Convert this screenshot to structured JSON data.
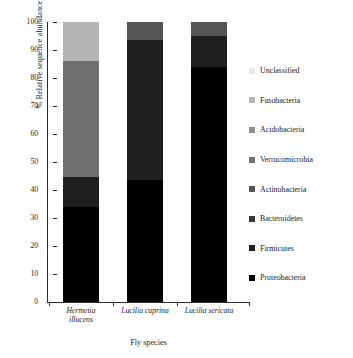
{
  "chart_data": {
    "type": "bar",
    "stacked": true,
    "title": "",
    "xlabel": "Fly species",
    "ylabel": "% Relative sequence abundance",
    "ylim": [
      0,
      100
    ],
    "yticks": [
      0,
      10,
      20,
      30,
      40,
      50,
      60,
      70,
      80,
      90,
      100
    ],
    "grid": false,
    "legend_position": "right",
    "categories": [
      "Hermetia illucens",
      "Lucilia cuprina",
      "Lucilia sericata"
    ],
    "series": [
      {
        "name": "Proteobacteria",
        "color": "#000000",
        "values": [
          33.8,
          43.4,
          83.9
        ]
      },
      {
        "name": "Firmicutes",
        "color": "#1f1f1f",
        "values": [
          11.0,
          50.1,
          11.0
        ]
      },
      {
        "name": "Bacteroidetes",
        "color": "#3a3a3a",
        "values": [
          0,
          0,
          0
        ]
      },
      {
        "name": "Actinobacteria",
        "color": "#555555",
        "values": [
          0,
          6.5,
          5.1
        ]
      },
      {
        "name": "Verrucomicrobia",
        "color": "#6f6f6f",
        "values": [
          41.3,
          0,
          0
        ]
      },
      {
        "name": "Acidobacteria",
        "color": "#8f8f8f",
        "values": [
          0,
          0,
          0
        ]
      },
      {
        "name": "Fusobacteria",
        "color": "#b5b5b5",
        "values": [
          13.9,
          0,
          0
        ]
      },
      {
        "name": "Unclassified",
        "color": "#e8e8e8",
        "values": [
          0,
          0,
          0
        ]
      }
    ],
    "legend_order": [
      "Unclassified",
      "Fusobacteria",
      "Acidobacteria",
      "Verrucomicrobia",
      "Actinobacteria",
      "Bacteroidetes",
      "Firmicutes",
      "Proteobacteria"
    ]
  }
}
